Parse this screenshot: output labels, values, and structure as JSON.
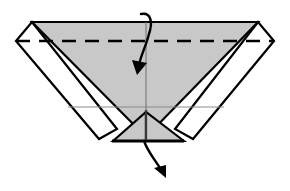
{
  "figure": {
    "type": "origami-instruction",
    "canvas": {
      "width": 290,
      "height": 191,
      "background": "#ffffff"
    },
    "colors": {
      "paper_front": "#c8c8c8",
      "paper_back": "#ffffff",
      "outline": "#000000",
      "crease_line": "#000000",
      "thin_guide": "#8a8a8a",
      "arrow": "#000000"
    },
    "geometry": {
      "top_edge": {
        "left_x": 32,
        "right_x": 258,
        "y": 22
      },
      "left_tip": {
        "x": 16,
        "y": 41
      },
      "right_tip": {
        "x": 274,
        "y": 41
      },
      "apex_bottom": {
        "x": 146,
        "y": 140
      },
      "bottom_edge": {
        "left_x": 112,
        "right_x": 184,
        "y": 141
      },
      "fold_line_y": 41,
      "guide_line_y": 107,
      "center_line_x": 146
    }
  },
  "shapes": {
    "gray_main_triangle": {
      "name": "main-gray-triangle",
      "points": "32,22 258,22 146,137"
    },
    "left_white_wing": {
      "name": "left-white-wing",
      "points": "16,41 32,22 117,129 99,139"
    },
    "right_white_wing": {
      "name": "right-white-wing",
      "points": "274,41 258,22 175,129 193,139"
    },
    "left_bottom_gray_flap": {
      "name": "left-bottom-gray-flap",
      "points": "113,141 146,112 146,141"
    },
    "right_bottom_gray_flap": {
      "name": "right-bottom-gray-flap",
      "points": "184,141 146,112 146,141"
    }
  },
  "lines": {
    "fold_dashed": {
      "name": "horizontal-valley-fold",
      "style": "dashed",
      "x1": 16,
      "y1": 41,
      "x2": 274,
      "y2": 41
    },
    "center_vertical": {
      "name": "vertical-center-crease",
      "style": "thin-solid",
      "x1": 146,
      "y1": 22,
      "x2": 146,
      "y2": 141
    },
    "guide_horizontal": {
      "name": "horizontal-guide-line",
      "style": "thin-solid",
      "x1": 68,
      "y1": 107,
      "x2": 224,
      "y2": 107
    },
    "bottom_edge": {
      "name": "bottom-edge-line",
      "style": "thick-solid",
      "x1": 112,
      "y1": 141,
      "x2": 184,
      "y2": 141
    }
  },
  "arrows": {
    "top": {
      "name": "fold-down-arrow",
      "label": "fold top layer down",
      "path": "M 141,14 C 151,12 153,22 149,34 C 146,46 141,55 139,65",
      "head": "137,75 132,60 147,63"
    },
    "bottom": {
      "name": "fold-out-arrow",
      "label": "fold flap outward and down",
      "path": "M 144,141 C 148,152 155,160 160,168",
      "head": "166,178 154,168 166,165"
    }
  }
}
